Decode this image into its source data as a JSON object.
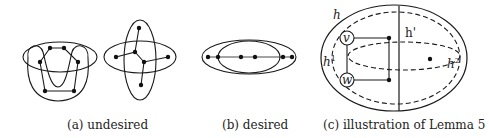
{
  "figure": {
    "panels": [
      {
        "id": "a",
        "caption": "(a) undesired",
        "description": "Two examples of overlapping hyperedges with crossing tree supports"
      },
      {
        "id": "b",
        "caption": "(b) desired",
        "description": "Two overlapping ellipses with collinear vertices on a path"
      },
      {
        "id": "c",
        "caption": "(c) illustration of Lemma 5",
        "labels": {
          "h": "h",
          "h1_base": "h",
          "h1_sup": "1",
          "hprime": "h'",
          "h2_base": "h",
          "h2_sup": "2",
          "v": "v",
          "w": "w"
        }
      }
    ],
    "colors": {
      "stroke": "#1a1a1a",
      "background": "#ffffff"
    }
  }
}
